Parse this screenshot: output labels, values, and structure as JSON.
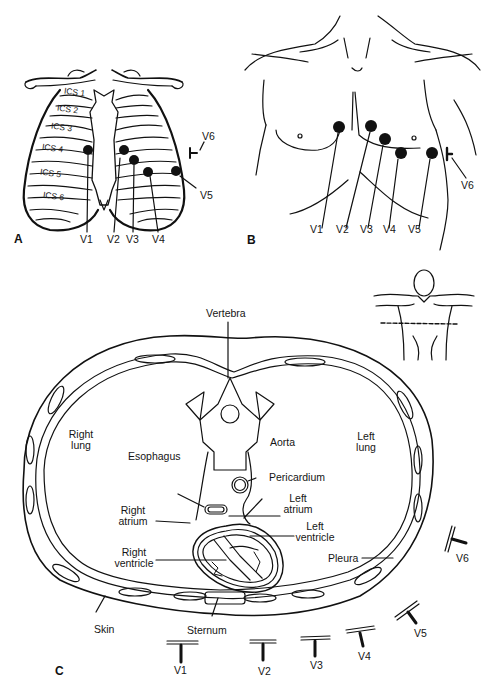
{
  "figure": {
    "panels": [
      {
        "id": "A",
        "label": "A",
        "description": "Anterior rib cage with intercostal spaces and chest electrode positions",
        "intercostal_spaces": [
          "ICS 1",
          "ICS 2",
          "ICS 3",
          "ICS 4",
          "ICS 5",
          "ICS 6"
        ],
        "leads": [
          "V1",
          "V2",
          "V3",
          "V4",
          "V5",
          "V6"
        ]
      },
      {
        "id": "B",
        "label": "B",
        "description": "Anterior torso surface with electrode positions",
        "leads": [
          "V1",
          "V2",
          "V3",
          "V4",
          "V5",
          "V6"
        ]
      },
      {
        "id": "C",
        "label": "C",
        "description": "Transverse section of thorax at electrode level",
        "structures": {
          "vertebra": "Vertebra",
          "right_lung": "Right\nlung",
          "left_lung": "Left\nlung",
          "esophagus": "Esophagus",
          "aorta": "Aorta",
          "pericardium": "Pericardium",
          "right_atrium": "Right\natrium",
          "left_atrium": "Left\natrium",
          "left_ventricle": "Left\nventricle",
          "right_ventricle": "Right\nventricle",
          "pleura": "Pleura",
          "skin": "Skin",
          "sternum": "Sternum"
        },
        "leads": [
          "V1",
          "V2",
          "V3",
          "V4",
          "V5",
          "V6"
        ]
      }
    ]
  },
  "a": {
    "panel": "A",
    "ics": [
      "ICS 1",
      "ICS 2",
      "ICS 3",
      "ICS 4",
      "ICS 5",
      "ICS 6"
    ],
    "v1": "V1",
    "v2": "V2",
    "v3": "V3",
    "v4": "V4",
    "v5": "V5",
    "v6": "V6"
  },
  "b": {
    "panel": "B",
    "v1": "V1",
    "v2": "V2",
    "v3": "V3",
    "v4": "V4",
    "v5": "V5",
    "v6": "V6"
  },
  "c": {
    "panel": "C",
    "vertebra": "Vertebra",
    "right_lung_1": "Right",
    "right_lung_2": "lung",
    "left_lung_1": "Left",
    "left_lung_2": "lung",
    "esophagus": "Esophagus",
    "aorta": "Aorta",
    "pericardium": "Pericardium",
    "right_atrium_1": "Right",
    "right_atrium_2": "atrium",
    "left_atrium_1": "Left",
    "left_atrium_2": "atrium",
    "left_ventricle_1": "Left",
    "left_ventricle_2": "ventricle",
    "right_ventricle_1": "Right",
    "right_ventricle_2": "ventricle",
    "pleura": "Pleura",
    "skin": "Skin",
    "sternum": "Sternum",
    "v1": "V1",
    "v2": "V2",
    "v3": "V3",
    "v4": "V4",
    "v5": "V5",
    "v6": "V6"
  },
  "colors": {
    "ink": "#111111",
    "background": "#ffffff"
  }
}
